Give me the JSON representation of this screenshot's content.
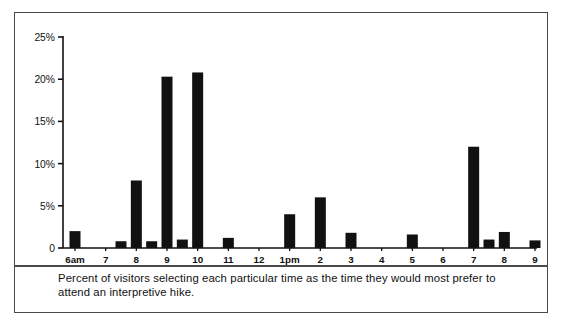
{
  "figure": {
    "caption": "Percent of visitors selecting each particular time as the time they would most prefer to attend an interpretive hike.",
    "border_color": "#4a4a4a",
    "background_color": "#ffffff",
    "bar_color": "#111111"
  },
  "chart_data": {
    "type": "bar",
    "title": "",
    "subtitle": "",
    "xlabel": "",
    "ylabel": "",
    "ylim": [
      0,
      25
    ],
    "yticks": [
      0,
      5,
      10,
      15,
      20,
      25
    ],
    "ytick_labels": [
      "0",
      "5%",
      "10%",
      "15%",
      "20%",
      "25%"
    ],
    "grid": false,
    "legend": null,
    "xtick_labels": [
      "6am",
      "7",
      "8",
      "9",
      "10",
      "11",
      "12",
      "1pm",
      "2",
      "3",
      "4",
      "5",
      "6",
      "7",
      "8",
      "9"
    ],
    "categories": [
      "6am",
      "6:30am",
      "7am",
      "7:30am",
      "8am",
      "8:30am",
      "9am",
      "9:30am",
      "10am",
      "10:30am",
      "11am",
      "11:30am",
      "12pm",
      "12:30pm",
      "1pm",
      "1:30pm",
      "2pm",
      "2:30pm",
      "3pm",
      "3:30pm",
      "4pm",
      "4:30pm",
      "5pm",
      "5:30pm",
      "6pm",
      "6:30pm",
      "7pm",
      "7:30pm",
      "8pm",
      "8:30pm",
      "9pm"
    ],
    "values": [
      2.0,
      0,
      0,
      0.8,
      8.0,
      0.8,
      20.3,
      1.0,
      20.8,
      0,
      1.2,
      0,
      0,
      0,
      4.0,
      0,
      6.0,
      0,
      1.8,
      0,
      0,
      0,
      1.6,
      0,
      0,
      0,
      12.0,
      1.0,
      1.9,
      0,
      0.9
    ]
  }
}
